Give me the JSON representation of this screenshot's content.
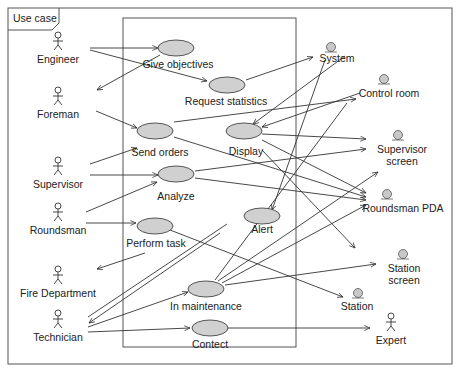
{
  "frame": {
    "title": "Use case"
  },
  "colors": {
    "line": "#333333",
    "usecase_fill": "#d0d0d0",
    "usecase_stroke": "#444444",
    "boundary_fill": "#c8c8c8"
  },
  "actors": [
    {
      "id": "engineer",
      "label": "Engineer"
    },
    {
      "id": "foreman",
      "label": "Foreman"
    },
    {
      "id": "supervisor",
      "label": "Supervisor"
    },
    {
      "id": "roundsman",
      "label": "Roundsman"
    },
    {
      "id": "fire_department",
      "label": "Fire Department"
    },
    {
      "id": "technician",
      "label": "Technician"
    },
    {
      "id": "expert",
      "label": "Expert"
    }
  ],
  "use_cases": [
    {
      "id": "give_objectives",
      "label": "Give objectives"
    },
    {
      "id": "request_statistics",
      "label": "Request statistics"
    },
    {
      "id": "send_orders",
      "label": "Send orders"
    },
    {
      "id": "display",
      "label": "Display"
    },
    {
      "id": "analyze",
      "label": "Analyze"
    },
    {
      "id": "perform_task",
      "label": "Perform task"
    },
    {
      "id": "alert",
      "label": "Alert"
    },
    {
      "id": "in_maintenance",
      "label": "In maintenance"
    },
    {
      "id": "contect",
      "label": "Contect"
    }
  ],
  "boundary_objects": [
    {
      "id": "system",
      "label": "System"
    },
    {
      "id": "control_room",
      "label": "Control room"
    },
    {
      "id": "supervisor_screen",
      "label_line1": "Supervisor",
      "label_line2": "screen"
    },
    {
      "id": "roundsman_pda",
      "label": "Roundsman PDA"
    },
    {
      "id": "station_screen",
      "label_line1": "Station",
      "label_line2": "screen"
    },
    {
      "id": "station",
      "label": "Station"
    }
  ]
}
